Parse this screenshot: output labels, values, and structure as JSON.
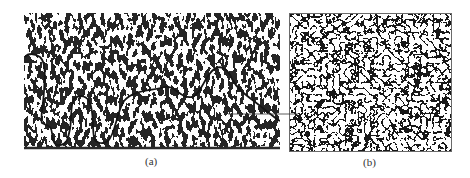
{
  "figure": {
    "panels": [
      {
        "id": "a",
        "label": "(a)",
        "content": "micrograph with crack path"
      },
      {
        "id": "b",
        "label": "(b)",
        "content": "grain structure micrograph"
      }
    ],
    "colors": {
      "ink": "#1a1a1a",
      "background": "#ffffff",
      "frame": "#6a6a6a"
    }
  }
}
